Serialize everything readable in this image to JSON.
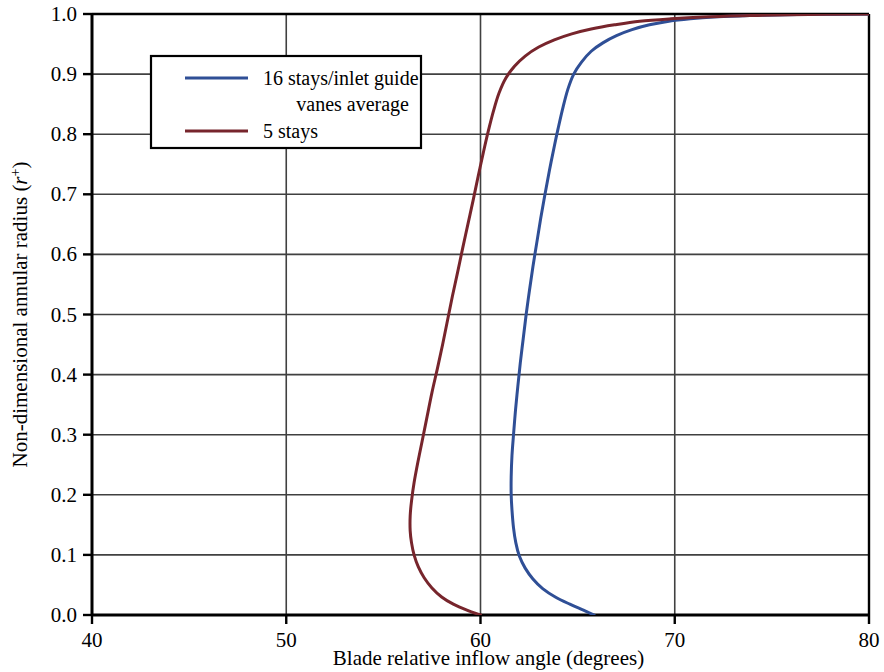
{
  "chart_data": {
    "type": "line",
    "title": "",
    "xlabel": "Blade relative inflow angle (degrees)",
    "ylabel": "Non-dimensional annular radius (r+)",
    "ylabel_main": "Non-dimensional annular radius (",
    "ylabel_symbol": "r",
    "ylabel_superscript": "+",
    "ylabel_close": ")",
    "xlim": [
      40,
      80
    ],
    "ylim": [
      0.0,
      1.0
    ],
    "xticks": [
      40,
      50,
      60,
      70,
      80
    ],
    "xtick_labels": [
      "40",
      "50",
      "60",
      "70",
      "80"
    ],
    "yticks": [
      0.0,
      0.1,
      0.2,
      0.3,
      0.4,
      0.5,
      0.6,
      0.7,
      0.8,
      0.9,
      1.0
    ],
    "ytick_labels": [
      "0.0",
      "0.1",
      "0.2",
      "0.3",
      "0.4",
      "0.5",
      "0.6",
      "0.7",
      "0.8",
      "0.9",
      "1.0"
    ],
    "grid": true,
    "grid_x": [
      50,
      60,
      70
    ],
    "grid_y": [
      0.1,
      0.2,
      0.3,
      0.4,
      0.5,
      0.6,
      0.7,
      0.8,
      0.9
    ],
    "legend_position": "upper-left",
    "series": [
      {
        "name": "16 stays/inlet guide vanes average",
        "color": "#2f4f96",
        "points_xy": [
          [
            65.85,
            0.0
          ],
          [
            65.3,
            0.008
          ],
          [
            64.6,
            0.018
          ],
          [
            63.85,
            0.03
          ],
          [
            63.2,
            0.044
          ],
          [
            62.7,
            0.06
          ],
          [
            62.3,
            0.078
          ],
          [
            62.0,
            0.098
          ],
          [
            61.82,
            0.12
          ],
          [
            61.7,
            0.145
          ],
          [
            61.62,
            0.175
          ],
          [
            61.58,
            0.2
          ],
          [
            61.58,
            0.23
          ],
          [
            61.62,
            0.265
          ],
          [
            61.7,
            0.3
          ],
          [
            61.8,
            0.34
          ],
          [
            61.92,
            0.38
          ],
          [
            62.05,
            0.42
          ],
          [
            62.2,
            0.46
          ],
          [
            62.35,
            0.5
          ],
          [
            62.52,
            0.54
          ],
          [
            62.7,
            0.58
          ],
          [
            62.9,
            0.62
          ],
          [
            63.1,
            0.66
          ],
          [
            63.32,
            0.7
          ],
          [
            63.55,
            0.74
          ],
          [
            63.8,
            0.78
          ],
          [
            64.0,
            0.81
          ],
          [
            64.25,
            0.845
          ],
          [
            64.5,
            0.875
          ],
          [
            64.8,
            0.9
          ],
          [
            65.2,
            0.92
          ],
          [
            65.7,
            0.938
          ],
          [
            66.3,
            0.952
          ],
          [
            67.0,
            0.964
          ],
          [
            67.8,
            0.974
          ],
          [
            68.7,
            0.982
          ],
          [
            69.7,
            0.988
          ],
          [
            70.8,
            0.992
          ],
          [
            72.0,
            0.995
          ],
          [
            73.5,
            0.997
          ],
          [
            75.0,
            0.9985
          ],
          [
            77.0,
            0.9995
          ],
          [
            80.0,
            1.0
          ]
        ]
      },
      {
        "name": "5 stays",
        "color": "#77252c",
        "points_xy": [
          [
            60.0,
            0.0
          ],
          [
            59.3,
            0.008
          ],
          [
            58.6,
            0.018
          ],
          [
            58.0,
            0.03
          ],
          [
            57.5,
            0.045
          ],
          [
            57.1,
            0.062
          ],
          [
            56.8,
            0.08
          ],
          [
            56.58,
            0.1
          ],
          [
            56.45,
            0.12
          ],
          [
            56.38,
            0.14
          ],
          [
            56.38,
            0.165
          ],
          [
            56.45,
            0.19
          ],
          [
            56.58,
            0.22
          ],
          [
            56.78,
            0.255
          ],
          [
            57.0,
            0.29
          ],
          [
            57.25,
            0.33
          ],
          [
            57.5,
            0.37
          ],
          [
            57.78,
            0.41
          ],
          [
            58.05,
            0.45
          ],
          [
            58.3,
            0.49
          ],
          [
            58.55,
            0.53
          ],
          [
            58.82,
            0.57
          ],
          [
            59.08,
            0.61
          ],
          [
            59.35,
            0.65
          ],
          [
            59.62,
            0.69
          ],
          [
            59.88,
            0.73
          ],
          [
            60.15,
            0.77
          ],
          [
            60.4,
            0.805
          ],
          [
            60.68,
            0.84
          ],
          [
            60.95,
            0.868
          ],
          [
            61.3,
            0.893
          ],
          [
            61.75,
            0.913
          ],
          [
            62.3,
            0.93
          ],
          [
            63.0,
            0.945
          ],
          [
            63.8,
            0.957
          ],
          [
            64.7,
            0.967
          ],
          [
            65.7,
            0.975
          ],
          [
            66.9,
            0.982
          ],
          [
            68.2,
            0.988
          ],
          [
            69.8,
            0.992
          ],
          [
            71.5,
            0.995
          ],
          [
            73.5,
            0.997
          ],
          [
            76.0,
            0.9988
          ],
          [
            80.0,
            1.0
          ]
        ]
      }
    ],
    "legend_entries": [
      {
        "label_line1": "16 stays/inlet guide",
        "label_line2": "vanes average",
        "color": "#2f4f96"
      },
      {
        "label_line1": "5 stays",
        "label_line2": "",
        "color": "#77252c"
      }
    ]
  },
  "colors": {
    "series_blue": "#2f4f96",
    "series_red": "#77252c",
    "axis": "#000000",
    "grid": "#404040",
    "background": "#ffffff"
  }
}
